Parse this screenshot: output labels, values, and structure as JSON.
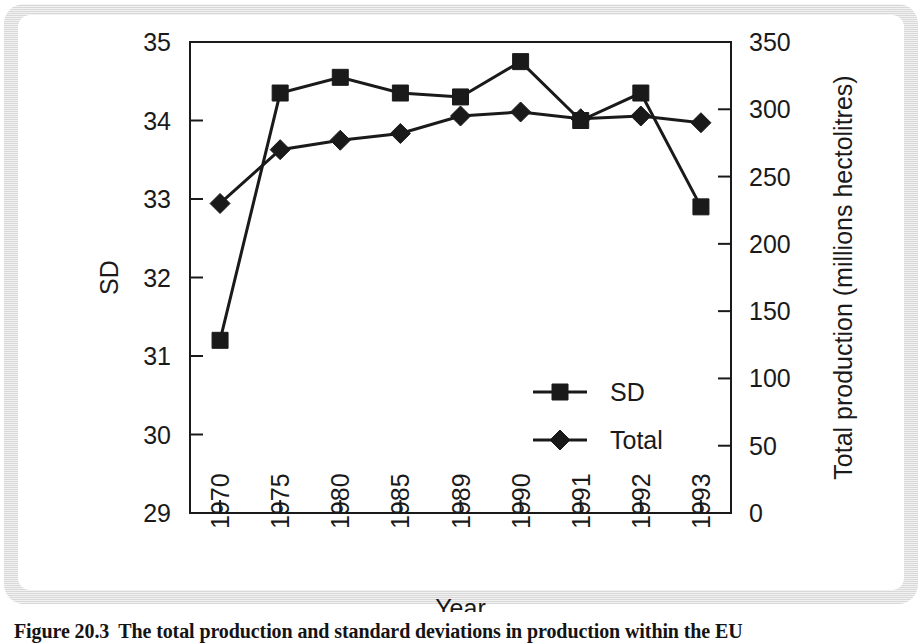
{
  "figure": {
    "caption_number": "Figure 20.3",
    "caption_text": "The total production and standard deviations in production within the EU"
  },
  "chart_data": {
    "type": "line",
    "title": "",
    "xlabel": "Year",
    "ylabel": "SD",
    "y2label": "Total production (millions hectolitres)",
    "categories": [
      "1970",
      "1975",
      "1980",
      "1985",
      "1989",
      "1990",
      "1991",
      "1992",
      "1993"
    ],
    "ylim": [
      29,
      35
    ],
    "y2lim": [
      0,
      350
    ],
    "yticks": [
      "29",
      "30",
      "31",
      "32",
      "33",
      "34",
      "35"
    ],
    "y2ticks": [
      "0",
      "50",
      "100",
      "150",
      "200",
      "250",
      "300",
      "350"
    ],
    "grid": false,
    "legend_position": "center-right",
    "series": [
      {
        "name": "SD",
        "axis": "left",
        "marker": "square",
        "values": [
          31.2,
          34.35,
          34.55,
          34.35,
          34.3,
          34.75,
          34.0,
          34.35,
          32.9
        ]
      },
      {
        "name": "Total",
        "axis": "right",
        "marker": "diamond",
        "values": [
          230,
          270,
          277,
          282,
          295,
          298,
          293,
          295,
          290
        ]
      }
    ]
  },
  "colors": {
    "ink": "#1a1a1a",
    "panel": "#ffffff",
    "frame": "#e4e4e4"
  }
}
